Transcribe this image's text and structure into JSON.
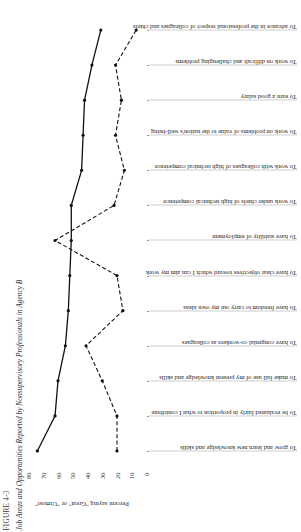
{
  "figure": {
    "number": "FIGURE 4-3",
    "title": "Job Areas and Opportunities Reported by Nonsupervisory Professionals in Agency B"
  },
  "chart_data": {
    "type": "line",
    "title": "Job Areas and Opportunities Reported by Nonsupervisory Professionals in Agency B",
    "xlabel": "",
    "ylabel": "Percent saying \"Great\" or \"Utmost\"",
    "ylim": [
      0,
      80
    ],
    "yticks": [
      0,
      10,
      20,
      30,
      40,
      50,
      60,
      70,
      80
    ],
    "grid": false,
    "legend_position": "none",
    "categories": [
      "To grow and learn new knowledge and skills",
      "To be evaluated fairly in proportion to what I contribute",
      "To make full use of my present knowledge and skills",
      "To have congenial co-workers as colleagues",
      "To have freedom to carry out my own ideas",
      "To have clear objectives toward which I can aim my work",
      "To have stability of employment",
      "To work under chiefs of high technical competence",
      "To work with colleagues of high technical competence",
      "To work on problems of value to the nation's well-being",
      "To earn a good salary",
      "To work on difficult and challenging problems",
      "To advance in the professional respect of colleagues and chiefs"
    ],
    "series": [
      {
        "name": "Importance",
        "style": "solid",
        "values": [
          74,
          62,
          60,
          55,
          53,
          52,
          51,
          51,
          44,
          43,
          42,
          37,
          31
        ]
      },
      {
        "name": "Opportunity",
        "style": "dashed",
        "values": [
          20,
          20,
          30,
          41,
          16,
          20,
          62,
          22,
          15,
          21,
          17,
          21,
          7
        ]
      }
    ]
  }
}
